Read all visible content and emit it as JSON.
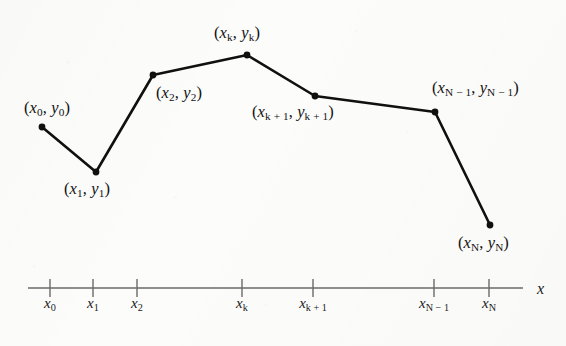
{
  "figure": {
    "background_color": "#fcfcfb",
    "ink_color": "#101010",
    "axis_color": "#6a6a6a"
  },
  "chart_data": {
    "type": "line",
    "title": "",
    "xlabel": "x",
    "ylabel": "",
    "grid": false,
    "legend": null,
    "marker": "filled-circle",
    "x": [
      "x_0",
      "x_1",
      "x_2",
      "x_k",
      "x_k+1",
      "x_N-1",
      "x_N"
    ],
    "series": [
      {
        "name": "polyline",
        "points": [
          {
            "label": "(x0, y0)",
            "px": 42,
            "py": 127
          },
          {
            "label": "(x1, y1)",
            "px": 96,
            "py": 172
          },
          {
            "label": "(x2, y2)",
            "px": 153,
            "py": 75
          },
          {
            "label": "(xk, yk)",
            "px": 247,
            "py": 55
          },
          {
            "label": "(xk+1, yk+1)",
            "px": 315,
            "py": 96
          },
          {
            "label": "(xN-1, yN-1)",
            "px": 435,
            "py": 112
          },
          {
            "label": "(xN, yN)",
            "px": 490,
            "py": 225
          }
        ]
      }
    ],
    "axis": {
      "line_y": 288,
      "x_start": 28,
      "x_end": 523,
      "tick_half_height": 9,
      "ticks": [
        {
          "id": "x0",
          "px": 50
        },
        {
          "id": "x1",
          "px": 93
        },
        {
          "id": "x2",
          "px": 137
        },
        {
          "id": "xk",
          "px": 242
        },
        {
          "id": "xk+1",
          "px": 313
        },
        {
          "id": "xN-1",
          "px": 434
        },
        {
          "id": "xN",
          "px": 489
        }
      ]
    }
  },
  "labels": {
    "points": [
      {
        "name": "label-x0-y0",
        "var": "x",
        "sub": "0",
        "var2": "y",
        "sub2": "0",
        "left": 24,
        "top": 100
      },
      {
        "name": "label-x1-y1",
        "var": "x",
        "sub": "1",
        "var2": "y",
        "sub2": "1",
        "left": 64,
        "top": 181
      },
      {
        "name": "label-x2-y2",
        "var": "x",
        "sub": "2",
        "var2": "y",
        "sub2": "2",
        "left": 156,
        "top": 85
      },
      {
        "name": "label-xk-yk",
        "var": "x",
        "sub": "k",
        "var2": "y",
        "sub2": "k",
        "left": 214,
        "top": 25
      },
      {
        "name": "label-xk1-yk1",
        "var": "x",
        "sub": "k + 1",
        "var2": "y",
        "sub2": "k + 1",
        "left": 252,
        "top": 104
      },
      {
        "name": "label-xN1-yN1",
        "var": "x",
        "sub": "N − 1",
        "var2": "y",
        "sub2": "N − 1",
        "left": 432,
        "top": 80
      },
      {
        "name": "label-xN-yN",
        "var": "x",
        "sub": "N",
        "var2": "y",
        "sub2": "N",
        "left": 458,
        "top": 235
      }
    ],
    "ticks": [
      {
        "name": "tick-label-x0",
        "var": "x",
        "sub": "0",
        "left": 50,
        "top": 296
      },
      {
        "name": "tick-label-x1",
        "var": "x",
        "sub": "1",
        "left": 93,
        "top": 296
      },
      {
        "name": "tick-label-x2",
        "var": "x",
        "sub": "2",
        "left": 137,
        "top": 296
      },
      {
        "name": "tick-label-xk",
        "var": "x",
        "sub": "k",
        "left": 242,
        "top": 296
      },
      {
        "name": "tick-label-xk1",
        "var": "x",
        "sub": "k + 1",
        "left": 313,
        "top": 296
      },
      {
        "name": "tick-label-xN1",
        "var": "x",
        "sub": "N − 1",
        "left": 434,
        "top": 296
      },
      {
        "name": "tick-label-xN",
        "var": "x",
        "sub": "N",
        "left": 489,
        "top": 296
      }
    ],
    "axis_name": {
      "text": "x",
      "left": 537,
      "top": 281
    }
  }
}
